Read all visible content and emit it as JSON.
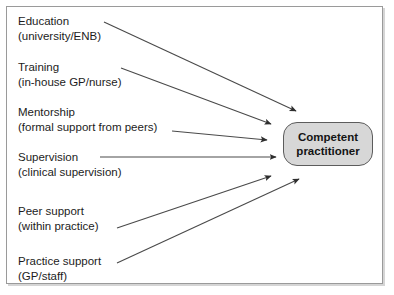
{
  "figure": {
    "type": "flow-diagram",
    "title": "",
    "background_color": "#ffffff",
    "frame_border_color": "#9a9a9a",
    "arrow_color": "#3c3c3c"
  },
  "target": {
    "name": "competent-practitioner",
    "line1": "Competent",
    "line2": "practitioner",
    "fill_color": "#d7d7d7",
    "border_color": "#5c5c5c",
    "text_color": "#141414"
  },
  "sources": [
    {
      "id": "education",
      "line1": "Education",
      "line2": "(university/ENB)"
    },
    {
      "id": "training",
      "line1": "Training",
      "line2": "(in-house GP/nurse)"
    },
    {
      "id": "mentorship",
      "line1": "Mentorship",
      "line2": "(formal support from peers)"
    },
    {
      "id": "supervision",
      "line1": "Supervision",
      "line2": "(clinical supervision)"
    },
    {
      "id": "peer-support",
      "line1": "Peer support",
      "line2": "(within practice)"
    },
    {
      "id": "practice-support",
      "line1": "Practice support",
      "line2": "(GP/staff)"
    }
  ],
  "connections": [
    {
      "from": "education",
      "to": "competent-practitioner"
    },
    {
      "from": "training",
      "to": "competent-practitioner"
    },
    {
      "from": "mentorship",
      "to": "competent-practitioner"
    },
    {
      "from": "supervision",
      "to": "competent-practitioner"
    },
    {
      "from": "peer-support",
      "to": "competent-practitioner"
    },
    {
      "from": "practice-support",
      "to": "competent-practitioner"
    }
  ]
}
